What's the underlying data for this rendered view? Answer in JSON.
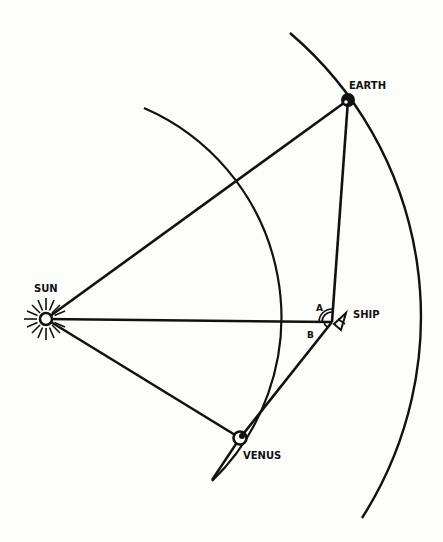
{
  "diagram": {
    "title": "",
    "labels": {
      "sun": "SUN",
      "earth": "EARTH",
      "venus": "VENUS",
      "ship": "SHIP",
      "angle_a": "A",
      "angle_b": "B"
    },
    "colors": {
      "ink": "#111111",
      "background": "#fdfdfb"
    },
    "nodes": {
      "sun": {
        "x": 46,
        "y": 319
      },
      "earth": {
        "x": 348,
        "y": 100
      },
      "venus": {
        "x": 240,
        "y": 438
      },
      "ship": {
        "x": 332,
        "y": 322
      }
    },
    "orbits": [
      {
        "name": "venus-orbit",
        "radius": 228
      },
      {
        "name": "earth-orbit",
        "radius": 373
      }
    ],
    "edges": [
      [
        "sun",
        "earth"
      ],
      [
        "sun",
        "ship"
      ],
      [
        "sun",
        "venus"
      ],
      [
        "ship",
        "earth"
      ],
      [
        "ship",
        "venus"
      ]
    ]
  }
}
